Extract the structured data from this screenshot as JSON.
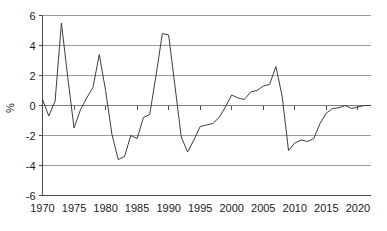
{
  "chart_data": {
    "type": "line",
    "title": "",
    "subtitle": "",
    "xlabel": "",
    "ylabel": "%",
    "xlim": [
      1970,
      2022
    ],
    "ylim": [
      -6,
      6
    ],
    "grid": true,
    "legend": null,
    "legend_position": "none",
    "line_color": "#3d3d3d",
    "grid_color": "#9a9a9a",
    "axis_color": "#4d4d4d",
    "background_color": "#ffffff",
    "xticks": [
      1970,
      1975,
      1980,
      1985,
      1990,
      1995,
      2000,
      2005,
      2010,
      2015,
      2020
    ],
    "xtick_labels": [
      "1970",
      "1975",
      "1980",
      "1985",
      "1990",
      "1995",
      "2000",
      "2005",
      "2010",
      "2015",
      "2020"
    ],
    "yticks": [
      -6,
      -4,
      -2,
      0,
      2,
      4,
      6
    ],
    "ytick_labels": [
      "-6",
      "-4",
      "-2",
      "0",
      "2",
      "4",
      "6"
    ],
    "x": [
      1970,
      1971,
      1972,
      1973,
      1974,
      1975,
      1976,
      1977,
      1978,
      1979,
      1980,
      1981,
      1982,
      1983,
      1984,
      1985,
      1986,
      1987,
      1988,
      1989,
      1990,
      1991,
      1992,
      1993,
      1994,
      1995,
      1996,
      1997,
      1998,
      1999,
      2000,
      2001,
      2002,
      2003,
      2004,
      2005,
      2006,
      2007,
      2008,
      2009,
      2010,
      2011,
      2012,
      2013,
      2014,
      2015,
      2016,
      2017,
      2018,
      2019,
      2020,
      2021,
      2022
    ],
    "values": [
      0.4,
      -0.7,
      0.3,
      5.5,
      1.9,
      -1.5,
      -0.3,
      0.5,
      1.2,
      3.4,
      1.0,
      -1.9,
      -3.6,
      -3.4,
      -2.0,
      -2.2,
      -0.8,
      -0.6,
      2.0,
      4.8,
      4.7,
      1.3,
      -2.1,
      -3.1,
      -2.3,
      -1.4,
      -1.3,
      -1.2,
      -0.8,
      -0.1,
      0.7,
      0.5,
      0.4,
      0.9,
      1.0,
      1.3,
      1.4,
      2.6,
      0.6,
      -3.0,
      -2.5,
      -2.3,
      -2.4,
      -2.2,
      -1.2,
      -0.5,
      -0.2,
      -0.15,
      0.0,
      -0.2,
      -0.1,
      0.0,
      0.0
    ],
    "series_name": ""
  },
  "axis": {
    "y_title": "%"
  }
}
